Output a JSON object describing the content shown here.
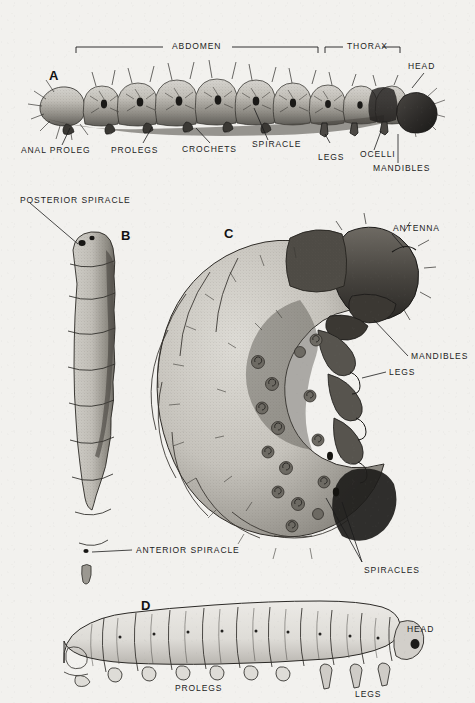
{
  "plate": {
    "background_color": "#f2f1ee",
    "ink_color": "#1c1c1c",
    "description": "Black and white scientific illustration plate of four insect larval body forms with anatomical leader-line labels"
  },
  "figures": [
    {
      "letter": "A",
      "name": "caterpillar-lepidopteran-larva",
      "orientation": "lateral, horizontal, head to the right",
      "brackets": [
        {
          "label": "ABDOMEN"
        },
        {
          "label": "THORAX"
        }
      ],
      "labels": [
        "HEAD",
        "ANAL PROLEG",
        "PROLEGS",
        "CROCHETS",
        "SPIRACLE",
        "LEGS",
        "OCELLI",
        "MANDIBLES"
      ]
    },
    {
      "letter": "B",
      "name": "maggot-dipteran-larva",
      "orientation": "vertical, legless, posterior end at top",
      "labels": [
        "POSTERIOR SPIRACLE",
        "ANTERIOR SPIRACLE"
      ]
    },
    {
      "letter": "C",
      "name": "grub-scarabaeiform-larva",
      "orientation": "C-shaped, head at upper right",
      "labels": [
        "ANTENNA",
        "MANDIBLES",
        "LEGS",
        "SPIRACLES"
      ]
    },
    {
      "letter": "D",
      "name": "eruciform-larva-outline",
      "orientation": "lateral, horizontal, head to the right",
      "labels": [
        "HEAD",
        "PROLEGS",
        "LEGS"
      ]
    }
  ],
  "annotations": {
    "a_abdomen": "ABDOMEN",
    "a_thorax": "THORAX",
    "a_head": "HEAD",
    "a_anal_proleg": "ANAL PROLEG",
    "a_prolegs": "PROLEGS",
    "a_crochets": "CROCHETS",
    "a_spiracle": "SPIRACLE",
    "a_legs": "LEGS",
    "a_ocelli": "OCELLI",
    "a_mandibles": "MANDIBLES",
    "b_posterior_spiracle": "POSTERIOR SPIRACLE",
    "b_anterior_spiracle": "ANTERIOR SPIRACLE",
    "c_antenna": "ANTENNA",
    "c_mandibles": "MANDIBLES",
    "c_legs": "LEGS",
    "c_spiracles": "SPIRACLES",
    "d_head": "HEAD",
    "d_prolegs": "PROLEGS",
    "d_legs": "LEGS"
  },
  "figure_letters": {
    "a": "A",
    "b": "B",
    "c": "C",
    "d": "D"
  }
}
